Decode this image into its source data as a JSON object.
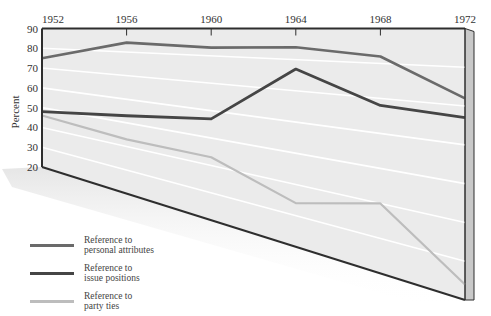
{
  "chart_data": {
    "type": "line",
    "title": "",
    "xlabel": "",
    "ylabel": "Percent",
    "categories": [
      "1952",
      "1956",
      "1960",
      "1964",
      "1968",
      "1972"
    ],
    "yticks": [
      90,
      80,
      70,
      60,
      50,
      40,
      30,
      20
    ],
    "ylim": [
      20,
      90
    ],
    "grid": true,
    "perspective": "3D skewed panel (top edge flat, bottom edge slopes down to the right)",
    "legend_position": "bottom-left",
    "series": [
      {
        "name": "Reference to personal attributes",
        "color": "#6a6a6a",
        "values": [
          75,
          84,
          83,
          84,
          82,
          72
        ]
      },
      {
        "name": "Reference to issue positions",
        "color": "#454545",
        "values": [
          48,
          53,
          57,
          77,
          68,
          67
        ]
      },
      {
        "name": "Reference to party ties",
        "color": "#bdbdbd",
        "values": [
          46,
          43,
          43,
          34,
          40,
          24
        ]
      }
    ]
  },
  "legend": [
    {
      "label": "Reference to\npersonal attributes",
      "color": "#6a6a6a"
    },
    {
      "label": "Reference to\nissue positions",
      "color": "#454545"
    },
    {
      "label": "Reference to\nparty ties",
      "color": "#bdbdbd"
    }
  ],
  "colors": {
    "panel": "#ebebeb",
    "gridline": "#ffffff",
    "frame": "#2e2e2e",
    "side_panel": "#c9c9c9"
  }
}
